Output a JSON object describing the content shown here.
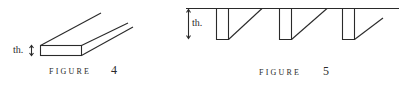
{
  "figures": [
    {
      "id": "figure-4",
      "caption_word": "FIGURE",
      "caption_number": "4",
      "thickness_label": "th."
    },
    {
      "id": "figure-5",
      "caption_word": "FIGURE",
      "caption_number": "5",
      "thickness_label": "th."
    }
  ],
  "colors": {
    "line": "#2a2a2a",
    "background": "#ffffff"
  }
}
